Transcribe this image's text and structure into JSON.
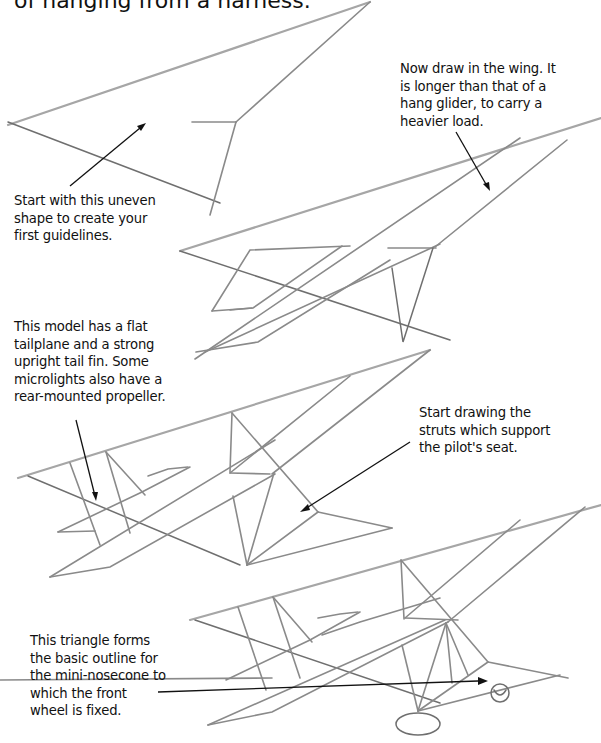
{
  "page": {
    "heading_fragment": "of hanging from a harness."
  },
  "steps": [
    {
      "id": "step-1",
      "caption": "Start with this uneven\nshape to create your\nfirst guidelines."
    },
    {
      "id": "step-2",
      "caption": "Now draw in the wing. It\nis longer than that of a\nhang glider, to carry a\nheavier load."
    },
    {
      "id": "step-3",
      "caption": "This model has a flat\ntailplane and a strong\nupright tail fin. Some\nmicrolights also have a\nrear-mounted propeller."
    },
    {
      "id": "step-3b",
      "caption": "Start drawing the\nstruts which support\nthe pilot's seat."
    },
    {
      "id": "step-4",
      "caption": "This triangle forms\nthe basic outline for\nthe mini-nosecone to\nwhich the front\nwheel is fixed."
    }
  ],
  "colors": {
    "pencil": "#8a8a8a",
    "ink": "#111111",
    "background": "#ffffff"
  }
}
